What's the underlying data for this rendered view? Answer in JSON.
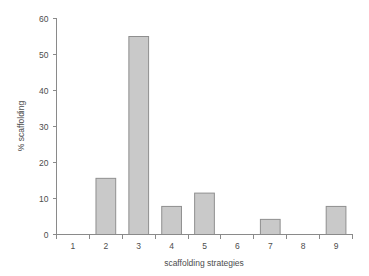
{
  "chart_data": {
    "type": "bar",
    "title": "",
    "subtitle": "",
    "xlabel": "scaffolding strategies",
    "ylabel": "% scaffolding",
    "categories": [
      "1",
      "2",
      "3",
      "4",
      "5",
      "6",
      "7",
      "8",
      "9"
    ],
    "values": [
      0,
      15.6,
      55,
      7.8,
      11.5,
      0,
      4.2,
      0,
      7.8
    ],
    "series": [
      {
        "name": "% scaffolding",
        "values": [
          0,
          15.6,
          55,
          7.8,
          11.5,
          0,
          4.2,
          0,
          7.8
        ]
      }
    ],
    "ylim": [
      0,
      60
    ],
    "yticks": [
      0,
      10,
      20,
      30,
      40,
      50,
      60
    ],
    "yticklabels": [
      "0",
      "10",
      "20",
      "30",
      "40",
      "50",
      "60"
    ],
    "xticklabels": [
      "1",
      "2",
      "3",
      "4",
      "5",
      "6",
      "7",
      "8",
      "9"
    ],
    "grid": false,
    "legend": false,
    "legend_position": "none",
    "bar_color": "#c9c9c9",
    "bar_edge_color": "#8f8f8f",
    "axis_color": "#8a8a8a",
    "background_color": "#ffffff"
  }
}
